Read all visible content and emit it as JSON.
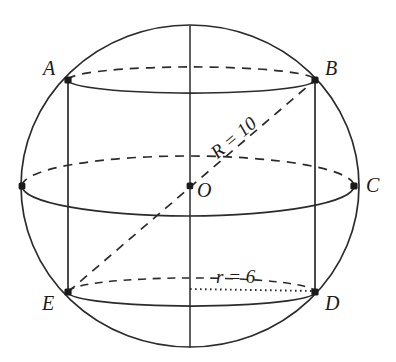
{
  "figure": {
    "stroke_color": "#2b2b2b",
    "background_color": "#ffffff",
    "sphere": {
      "center": {
        "x": 190,
        "y": 186,
        "label": "O"
      },
      "radius_x": 168,
      "radius_y": 161
    },
    "vertices": [
      {
        "id": "A",
        "label": "A",
        "x": 68,
        "y": 80,
        "label_x": 43,
        "label_y": 58
      },
      {
        "id": "B",
        "label": "B",
        "x": 315,
        "y": 80,
        "label_x": 325,
        "label_y": 58
      },
      {
        "id": "C",
        "label": "C",
        "x": 354,
        "y": 186,
        "label_x": 366,
        "label_y": 175
      },
      {
        "id": "D",
        "label": "D",
        "x": 315,
        "y": 292,
        "label_x": 325,
        "label_y": 293
      },
      {
        "id": "E",
        "label": "E",
        "x": 68,
        "y": 292,
        "label_x": 42,
        "label_y": 293
      },
      {
        "id": "O",
        "label": "O",
        "x": 190,
        "y": 186,
        "label_x": 197,
        "label_y": 180
      },
      {
        "id": "W",
        "label": "",
        "x": 22,
        "y": 186,
        "label_x": 0,
        "label_y": 0
      }
    ],
    "measures": [
      {
        "id": "R",
        "label": "R = 10",
        "x": 213,
        "y": 145,
        "rotation_deg": -40
      },
      {
        "id": "r",
        "label": "r = 6",
        "x": 216,
        "y": 267,
        "rotation_deg": 0
      }
    ],
    "ellipses": {
      "top": {
        "cx": 191,
        "cy": 80,
        "rx": 123,
        "ry": 13,
        "front": "solid",
        "back": "dashed"
      },
      "equator": {
        "cx": 188,
        "cy": 186,
        "rx": 166,
        "ry": 30,
        "front": "solid",
        "back": "dashed"
      },
      "bottom": {
        "cx": 191,
        "cy": 292,
        "rx": 123,
        "ry": 14,
        "front": "solid",
        "back": "dashed"
      }
    },
    "segments": [
      {
        "id": "axis",
        "from": "top-pole",
        "to": "bottom-pole",
        "style": "solid"
      },
      {
        "id": "AE",
        "from": "A",
        "to": "E",
        "style": "solid"
      },
      {
        "id": "BD",
        "from": "B",
        "to": "D",
        "style": "solid"
      },
      {
        "id": "EB-diagonal",
        "from": "E",
        "to": "B",
        "style": "dashed"
      },
      {
        "id": "EO-radius",
        "from": "E",
        "to": "O",
        "style": "dashed"
      },
      {
        "id": "OD-radius",
        "from": "O-bottom",
        "to": "D",
        "style": "dotted"
      }
    ]
  }
}
